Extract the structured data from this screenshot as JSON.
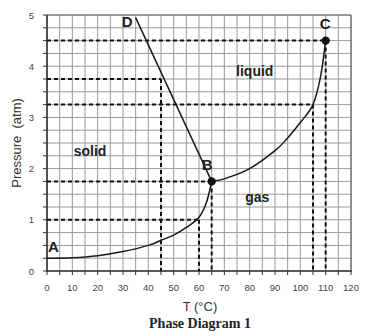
{
  "chart_data": {
    "type": "line",
    "title": "Phase Diagram 1",
    "xlabel": "T (°C)",
    "ylabel": "Pressure  (atm)",
    "xlim": [
      0,
      120
    ],
    "ylim": [
      0,
      5
    ],
    "x_ticks": [
      0,
      10,
      20,
      30,
      40,
      50,
      60,
      70,
      80,
      90,
      100,
      110,
      120
    ],
    "y_ticks": [
      0,
      1,
      2,
      3,
      4,
      5
    ],
    "grid": {
      "on": true,
      "x_step": 5,
      "y_step": 0.25
    },
    "regions": [
      {
        "label": "solid",
        "T": 17,
        "P": 2.35
      },
      {
        "label": "liquid",
        "T": 82,
        "P": 3.9
      },
      {
        "label": "gas",
        "T": 83,
        "P": 1.45
      }
    ],
    "points": [
      {
        "label": "A",
        "T": 0,
        "P": 0.25
      },
      {
        "label": "B",
        "T": 65,
        "P": 1.75,
        "marker": true
      },
      {
        "label": "C",
        "T": 110,
        "P": 4.5,
        "marker": true
      },
      {
        "label": "D",
        "T": 35,
        "P": 4.95
      }
    ],
    "series": [
      {
        "name": "sublimation curve A-B",
        "points": [
          [
            0,
            0.25
          ],
          [
            10,
            0.26
          ],
          [
            20,
            0.3
          ],
          [
            30,
            0.38
          ],
          [
            40,
            0.5
          ],
          [
            45,
            0.6
          ],
          [
            50,
            0.7
          ],
          [
            55,
            0.85
          ],
          [
            60,
            1.05
          ],
          [
            63,
            1.35
          ],
          [
            65,
            1.75
          ]
        ]
      },
      {
        "name": "melting curve B-D",
        "points": [
          [
            65,
            1.75
          ],
          [
            35,
            4.95
          ]
        ]
      },
      {
        "name": "vaporization curve B-C",
        "points": [
          [
            65,
            1.75
          ],
          [
            70,
            1.8
          ],
          [
            80,
            2.0
          ],
          [
            90,
            2.35
          ],
          [
            95,
            2.6
          ],
          [
            100,
            2.9
          ],
          [
            105,
            3.25
          ],
          [
            108,
            3.8
          ],
          [
            110,
            4.5
          ]
        ]
      }
    ],
    "reference_lines": {
      "horizontal": [
        {
          "P": 4.5,
          "T_to": 110
        },
        {
          "P": 3.75,
          "T_to": 45
        },
        {
          "P": 3.25,
          "T_to": 105
        },
        {
          "P": 1.75,
          "T_to": 65
        },
        {
          "P": 1.0,
          "T_to": 60
        }
      ],
      "vertical": [
        {
          "T": 45,
          "P_from": 3.75
        },
        {
          "T": 60,
          "P_from": 1.0
        },
        {
          "T": 65,
          "P_from": 1.75
        },
        {
          "T": 105,
          "P_from": 3.25
        },
        {
          "T": 110,
          "P_from": 4.5
        }
      ]
    }
  },
  "plot_area": {
    "x0": 47,
    "x1": 351,
    "y0": 271,
    "y1": 15
  },
  "colors": {
    "grid": "#9a9a9a",
    "curve": "#1a1a1a",
    "dash": "#111111",
    "axis": "#333333"
  }
}
